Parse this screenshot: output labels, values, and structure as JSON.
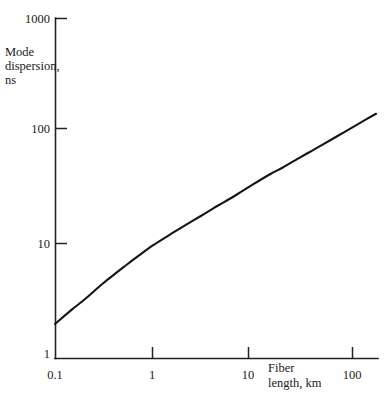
{
  "chart_data": {
    "type": "line",
    "title": "",
    "xlabel": "Fiber length, km",
    "ylabel": "Mode dispersion, ns",
    "xscale": "log",
    "yscale": "log",
    "xlim": [
      0.1,
      180
    ],
    "ylim": [
      1,
      1000
    ],
    "grid": false,
    "legend": null,
    "xticks": [
      0.1,
      1,
      10,
      100
    ],
    "xtick_labels": [
      "0.1",
      "1",
      "10",
      "100"
    ],
    "yticks": [
      1,
      10,
      100,
      1000
    ],
    "ytick_labels": [
      "1",
      "10",
      "100",
      "1000"
    ],
    "series": [
      {
        "name": "Mode dispersion",
        "x": [
          0.1,
          0.15,
          0.2,
          0.3,
          0.4,
          0.5,
          0.7,
          1.0,
          1.5,
          2.0,
          3.0,
          4.0,
          5.0,
          7.0,
          10.0,
          15.0,
          20.0,
          30.0,
          40.0,
          50.0,
          70.0,
          100.0,
          140.0,
          175.0
        ],
        "y": [
          2.0,
          2.7,
          3.3,
          4.5,
          5.5,
          6.4,
          8.0,
          10.0,
          12.5,
          14.6,
          18.0,
          21.0,
          23.5,
          28.0,
          34.0,
          42.0,
          48.0,
          59.0,
          68.0,
          76.0,
          90.0,
          108.0,
          128.0,
          143.0
        ]
      }
    ]
  },
  "axis_labels": {
    "y_title_line1": "Mode",
    "y_title_line2": "dispersion,",
    "y_title_line3": "ns",
    "x_title_line1": "Fiber",
    "x_title_line2": "length, km"
  },
  "colors": {
    "curve": "#151515",
    "axis": "#222222",
    "text": "#1a1a1a",
    "background": "#ffffff"
  }
}
